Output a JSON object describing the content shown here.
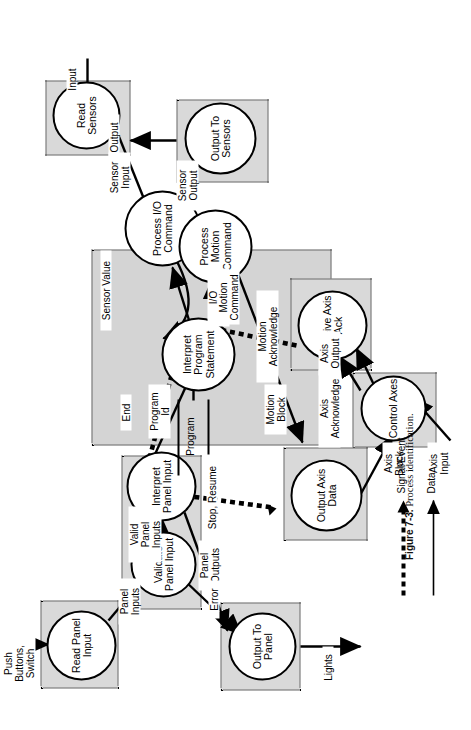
{
  "figure": {
    "number": "Figure 7-3.",
    "caption": "Process identification.",
    "orientation": "rotated-90-ccw"
  },
  "legend": {
    "items": [
      {
        "label": "Signal/Event",
        "style": "dashed-arrow",
        "color": "#000000"
      },
      {
        "label": "Data",
        "style": "solid-arrow",
        "color": "#000000"
      }
    ]
  },
  "terminators": [
    {
      "name": "program",
      "label": "Program"
    }
  ],
  "contexts": [
    {
      "name": "read-sensors-context",
      "fill": "#d9d9d9"
    },
    {
      "name": "output-to-sensors-context",
      "fill": "#d9d9d9"
    },
    {
      "name": "interpreter-context",
      "fill": "#d4d4d4"
    },
    {
      "name": "receive-axis-ack-context",
      "fill": "#d9d9d9"
    },
    {
      "name": "control-axes-context",
      "fill": "#d9d9d9"
    },
    {
      "name": "output-axis-data-context",
      "fill": "#d9d9d9"
    },
    {
      "name": "panel-input-context",
      "fill": "#d9d9d9"
    },
    {
      "name": "read-panel-input-context",
      "fill": "#d9d9d9"
    },
    {
      "name": "output-to-panel-context",
      "fill": "#d9d9d9"
    }
  ],
  "processes": [
    {
      "id": "read-sensors",
      "label": "Read\nSensors"
    },
    {
      "id": "output-to-sensors",
      "label": "Output\nTo\nSensors"
    },
    {
      "id": "process-io-command",
      "label": "Process\nI/O\nCommand"
    },
    {
      "id": "interpret-program-statement",
      "label": "Interpret\nProgram\nStatement"
    },
    {
      "id": "process-motion-command",
      "label": "Process\nMotion\nCommand"
    },
    {
      "id": "receive-axis-ack",
      "label": "Receive\nAxis\nAck"
    },
    {
      "id": "control-axes",
      "label": "Control\nAxes"
    },
    {
      "id": "output-axis-data",
      "label": "Output\nAxis\nData"
    },
    {
      "id": "interpret-panel-input",
      "label": "Interpret\nPanel\nInput"
    },
    {
      "id": "validate-panel-input",
      "label": "Validate\nPanel\nInput"
    },
    {
      "id": "read-panel-input",
      "label": "Read\nPanel\nInput"
    },
    {
      "id": "output-to-panel",
      "label": "Output\nTo\nPanel"
    }
  ],
  "flows": [
    {
      "id": "input",
      "label": "Input",
      "kind": "data",
      "from": "external",
      "to": "read-sensors"
    },
    {
      "id": "sensor-input",
      "label": "Sensor\nInput",
      "kind": "data",
      "from": "read-sensors",
      "to": "process-io-command"
    },
    {
      "id": "sensor-output",
      "label": "Sensor\nOutput",
      "kind": "data",
      "from": "process-io-command",
      "to": "output-to-sensors"
    },
    {
      "id": "output",
      "label": "Output",
      "kind": "data",
      "from": "output-to-sensors",
      "to": "external"
    },
    {
      "id": "sensor-value",
      "label": "Sensor Value",
      "kind": "data",
      "from": "process-io-command",
      "to": "interpret-program-statement"
    },
    {
      "id": "io-command",
      "label": "I/O\nCommand",
      "kind": "data",
      "from": "interpret-program-statement",
      "to": "process-io-command"
    },
    {
      "id": "motion-command",
      "label": "Motion\nCommand",
      "kind": "data",
      "from": "interpret-program-statement",
      "to": "process-motion-command"
    },
    {
      "id": "motion-acknowledge",
      "label": "Motion\nAcknowledge",
      "kind": "signal",
      "from": "receive-axis-ack",
      "to": "interpret-program-statement"
    },
    {
      "id": "motion-block",
      "label": "Motion\nBlock",
      "kind": "data",
      "from": "process-motion-command",
      "to": "output-axis-data"
    },
    {
      "id": "axis-block",
      "label": "Axis\nBlock",
      "kind": "data",
      "from": "output-axis-data",
      "to": "control-axes"
    },
    {
      "id": "axis-input",
      "label": "Axis\nInput",
      "kind": "data",
      "from": "external",
      "to": "control-axes"
    },
    {
      "id": "axis-output",
      "label": "Axis\nOutput",
      "kind": "data",
      "from": "control-axes",
      "to": "external"
    },
    {
      "id": "axis-acknowledge",
      "label": "Axis\nAcknowledge",
      "kind": "signal",
      "from": "control-axes",
      "to": "receive-axis-ack"
    },
    {
      "id": "program",
      "label": "Program",
      "kind": "data",
      "from": "external",
      "to": "interpret-program-statement"
    },
    {
      "id": "program-id",
      "label": "Program\nId",
      "kind": "data",
      "from": "interpret-panel-input",
      "to": "interpret-program-statement"
    },
    {
      "id": "end",
      "label": "End",
      "kind": "signal",
      "from": "interpret-panel-input",
      "to": "interpret-program-statement"
    },
    {
      "id": "stop-resume",
      "label": "Stop, Resume",
      "kind": "signal",
      "from": "interpret-panel-input",
      "to": "output-axis-data"
    },
    {
      "id": "valid-panel-inputs",
      "label": "Valid\nPanel\nInputs",
      "kind": "data",
      "from": "validate-panel-input",
      "to": "interpret-panel-input"
    },
    {
      "id": "panel-inputs",
      "label": "Panel\nInputs",
      "kind": "data",
      "from": "read-panel-input",
      "to": "validate-panel-input"
    },
    {
      "id": "push-buttons-switch",
      "label": "Push\nButtons,\nSwitch",
      "kind": "data",
      "from": "external",
      "to": "read-panel-input"
    },
    {
      "id": "panel-outputs",
      "label": "Panel\nOutputs",
      "kind": "data",
      "from": "interpret-panel-input",
      "to": "output-to-panel"
    },
    {
      "id": "error",
      "label": "Error",
      "kind": "data",
      "from": "validate-panel-input",
      "to": "output-to-panel"
    },
    {
      "id": "lights",
      "label": "Lights",
      "kind": "data",
      "from": "output-to-panel",
      "to": "external"
    }
  ]
}
